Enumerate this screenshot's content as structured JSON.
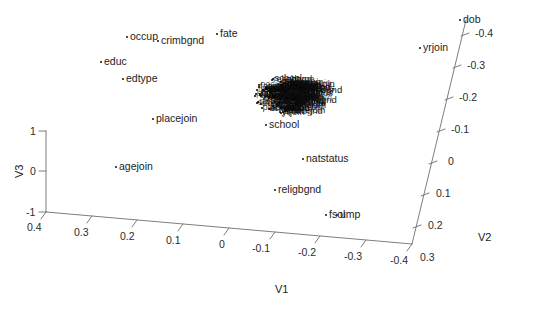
{
  "chart_data": {
    "type": "scatter",
    "projection": "3d",
    "title": "",
    "subtitle": "",
    "xlabel": "V1",
    "ylabel": "V2",
    "zlabel": "V3",
    "grid": false,
    "legend": false,
    "axes": {
      "V1": {
        "label": "V1",
        "ticks": [
          "0.4",
          "0.3",
          "0.2",
          "0.1",
          "0",
          "-0.1",
          "-0.2",
          "-0.3",
          "-0.4"
        ],
        "tick_values": [
          0.4,
          0.3,
          0.2,
          0.1,
          0,
          -0.1,
          -0.2,
          -0.3,
          -0.4
        ],
        "range": [
          0.4,
          -0.4
        ],
        "direction": "decreasing-left-to-right"
      },
      "V2": {
        "label": "V2",
        "ticks": [
          "-0.4",
          "-0.3",
          "-0.2",
          "-0.1",
          "0",
          "0.1",
          "0.2",
          "0.3"
        ],
        "tick_values": [
          -0.4,
          -0.3,
          -0.2,
          -0.1,
          0,
          0.1,
          0.2,
          0.3
        ],
        "range": [
          -0.4,
          0.3
        ],
        "direction": "increasing-top-to-bottom"
      },
      "V3": {
        "label": "V3",
        "ticks": [
          "1",
          "0",
          "-1"
        ],
        "tick_values": [
          1,
          0,
          -1
        ],
        "range": [
          -1,
          1
        ],
        "direction": "increasing-bottom-to-top"
      }
    },
    "outlier_labels": [
      "occup",
      "crimbgnd",
      "fate",
      "educ",
      "edtype",
      "placejoin",
      "school",
      "dob",
      "yrjoin",
      "agejoin",
      "natstatus",
      "religbgnd",
      "fsol",
      "ump"
    ],
    "cluster": {
      "description": "dense overplotted cluster of variable labels near V1 -0.05, V2 -0.1, V3 0.4",
      "center_v1": -0.05,
      "center_v2": -0.1,
      "center_v3": 0.4,
      "approx_point_count": 120
    },
    "points": [
      {
        "label": "occup",
        "v1": 0.26,
        "v2": -0.16,
        "v3": 0.95
      },
      {
        "label": "crimbgnd",
        "v1": 0.2,
        "v2": -0.14,
        "v3": 0.95
      },
      {
        "label": "fate",
        "v1": 0.13,
        "v2": -0.13,
        "v3": 0.96
      },
      {
        "label": "educ",
        "v1": 0.29,
        "v2": -0.14,
        "v3": 0.82
      },
      {
        "label": "edtype",
        "v1": 0.25,
        "v2": -0.13,
        "v3": 0.74
      },
      {
        "label": "placejoin",
        "v1": 0.2,
        "v2": -0.08,
        "v3": 0.48
      },
      {
        "label": "school",
        "v1": -0.03,
        "v2": -0.09,
        "v3": 0.25
      },
      {
        "label": "dob",
        "v1": -0.29,
        "v2": -0.4,
        "v3": 1.0
      },
      {
        "label": "yrjoin",
        "v1": -0.24,
        "v2": -0.36,
        "v3": 0.88
      },
      {
        "label": "agejoin",
        "v1": 0.29,
        "v2": 0.02,
        "v3": -0.12
      },
      {
        "label": "natstatus",
        "v1": -0.06,
        "v2": -0.02,
        "v3": -0.1
      },
      {
        "label": "religbgnd",
        "v1": -0.03,
        "v2": 0.05,
        "v3": -0.4
      },
      {
        "label": "fsol",
        "v1": -0.14,
        "v2": 0.11,
        "v3": -0.62
      },
      {
        "label": "ump",
        "v1": -0.16,
        "v2": 0.11,
        "v3": -0.62
      }
    ]
  },
  "labels": {
    "v1_title": "V1",
    "v2_title": "V2",
    "v3_title": "V3",
    "v1_ticks": [
      "0.4",
      "0.3",
      "0.2",
      "0.1",
      "0",
      "-0.1",
      "-0.2",
      "-0.3",
      "-0.4"
    ],
    "v2_ticks": [
      "-0.4",
      "-0.3",
      "-0.2",
      "-0.1",
      "0",
      "0.1",
      "0.2",
      "0.3"
    ],
    "v3_ticks": [
      "1",
      "0",
      "-1"
    ],
    "points": [
      "occup",
      "crimbgnd",
      "fate",
      "educ",
      "edtype",
      "placejoin",
      "school",
      "dob",
      "yrjoin",
      "agejoin",
      "natstatus",
      "religbgnd",
      "fsol",
      "ump"
    ]
  }
}
